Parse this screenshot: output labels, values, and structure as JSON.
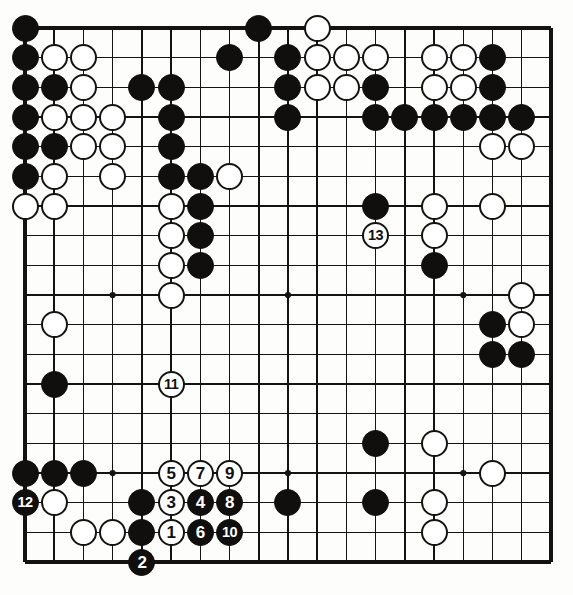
{
  "diagram": {
    "kind": "go-board-diagram",
    "board_size": 19,
    "title": "",
    "colors": {
      "board_background": "#fdfdfb",
      "line": "#141312",
      "black_stone": "#100f0d",
      "white_stone": "#ffffff",
      "black_label_text": "#ffffff",
      "white_label_text": "#111111"
    },
    "geometry": {
      "left": 25,
      "top": 28,
      "right": 551,
      "bottom": 562,
      "col_step": 29.22,
      "row_step": 29.67,
      "stone_diameter": 27
    },
    "star_points": [
      {
        "col": 4,
        "row": 4
      },
      {
        "col": 10,
        "row": 4
      },
      {
        "col": 16,
        "row": 4
      },
      {
        "col": 4,
        "row": 10
      },
      {
        "col": 10,
        "row": 10
      },
      {
        "col": 16,
        "row": 10
      },
      {
        "col": 4,
        "row": 16
      },
      {
        "col": 10,
        "row": 16
      },
      {
        "col": 16,
        "row": 16
      }
    ],
    "stones": [
      {
        "col": 1,
        "row": 1,
        "color": "black"
      },
      {
        "col": 9,
        "row": 1,
        "color": "black"
      },
      {
        "col": 11,
        "row": 1,
        "color": "white"
      },
      {
        "col": 1,
        "row": 2,
        "color": "black"
      },
      {
        "col": 2,
        "row": 2,
        "color": "white"
      },
      {
        "col": 3,
        "row": 2,
        "color": "white"
      },
      {
        "col": 8,
        "row": 2,
        "color": "black"
      },
      {
        "col": 10,
        "row": 2,
        "color": "black"
      },
      {
        "col": 11,
        "row": 2,
        "color": "white"
      },
      {
        "col": 12,
        "row": 2,
        "color": "white"
      },
      {
        "col": 13,
        "row": 2,
        "color": "white"
      },
      {
        "col": 15,
        "row": 2,
        "color": "white"
      },
      {
        "col": 16,
        "row": 2,
        "color": "white"
      },
      {
        "col": 17,
        "row": 2,
        "color": "black"
      },
      {
        "col": 1,
        "row": 3,
        "color": "black"
      },
      {
        "col": 2,
        "row": 3,
        "color": "black"
      },
      {
        "col": 3,
        "row": 3,
        "color": "white"
      },
      {
        "col": 5,
        "row": 3,
        "color": "black"
      },
      {
        "col": 6,
        "row": 3,
        "color": "black"
      },
      {
        "col": 10,
        "row": 3,
        "color": "black"
      },
      {
        "col": 11,
        "row": 3,
        "color": "white"
      },
      {
        "col": 12,
        "row": 3,
        "color": "white"
      },
      {
        "col": 13,
        "row": 3,
        "color": "black"
      },
      {
        "col": 15,
        "row": 3,
        "color": "white"
      },
      {
        "col": 16,
        "row": 3,
        "color": "white"
      },
      {
        "col": 17,
        "row": 3,
        "color": "black"
      },
      {
        "col": 1,
        "row": 4,
        "color": "black"
      },
      {
        "col": 2,
        "row": 4,
        "color": "white"
      },
      {
        "col": 3,
        "row": 4,
        "color": "white"
      },
      {
        "col": 4,
        "row": 4,
        "color": "white"
      },
      {
        "col": 6,
        "row": 4,
        "color": "black"
      },
      {
        "col": 10,
        "row": 4,
        "color": "black"
      },
      {
        "col": 13,
        "row": 4,
        "color": "black"
      },
      {
        "col": 14,
        "row": 4,
        "color": "black"
      },
      {
        "col": 15,
        "row": 4,
        "color": "black"
      },
      {
        "col": 16,
        "row": 4,
        "color": "black"
      },
      {
        "col": 17,
        "row": 4,
        "color": "black"
      },
      {
        "col": 18,
        "row": 4,
        "color": "black"
      },
      {
        "col": 1,
        "row": 5,
        "color": "black"
      },
      {
        "col": 2,
        "row": 5,
        "color": "black"
      },
      {
        "col": 3,
        "row": 5,
        "color": "white"
      },
      {
        "col": 4,
        "row": 5,
        "color": "white"
      },
      {
        "col": 6,
        "row": 5,
        "color": "black"
      },
      {
        "col": 17,
        "row": 5,
        "color": "white"
      },
      {
        "col": 18,
        "row": 5,
        "color": "white"
      },
      {
        "col": 1,
        "row": 6,
        "color": "black"
      },
      {
        "col": 2,
        "row": 6,
        "color": "white"
      },
      {
        "col": 4,
        "row": 6,
        "color": "white"
      },
      {
        "col": 6,
        "row": 6,
        "color": "black"
      },
      {
        "col": 7,
        "row": 6,
        "color": "black"
      },
      {
        "col": 8,
        "row": 6,
        "color": "white"
      },
      {
        "col": 1,
        "row": 7,
        "color": "white"
      },
      {
        "col": 2,
        "row": 7,
        "color": "white"
      },
      {
        "col": 6,
        "row": 7,
        "color": "white"
      },
      {
        "col": 7,
        "row": 7,
        "color": "black"
      },
      {
        "col": 13,
        "row": 7,
        "color": "black"
      },
      {
        "col": 15,
        "row": 7,
        "color": "white"
      },
      {
        "col": 17,
        "row": 7,
        "color": "white"
      },
      {
        "col": 6,
        "row": 8,
        "color": "white"
      },
      {
        "col": 7,
        "row": 8,
        "color": "black"
      },
      {
        "col": 15,
        "row": 8,
        "color": "white"
      },
      {
        "col": 6,
        "row": 9,
        "color": "white"
      },
      {
        "col": 7,
        "row": 9,
        "color": "black"
      },
      {
        "col": 15,
        "row": 9,
        "color": "black"
      },
      {
        "col": 6,
        "row": 10,
        "color": "white"
      },
      {
        "col": 18,
        "row": 10,
        "color": "white"
      },
      {
        "col": 2,
        "row": 11,
        "color": "white"
      },
      {
        "col": 17,
        "row": 11,
        "color": "black"
      },
      {
        "col": 18,
        "row": 11,
        "color": "white"
      },
      {
        "col": 17,
        "row": 12,
        "color": "black"
      },
      {
        "col": 18,
        "row": 12,
        "color": "black"
      },
      {
        "col": 2,
        "row": 13,
        "color": "black"
      },
      {
        "col": 13,
        "row": 15,
        "color": "black"
      },
      {
        "col": 15,
        "row": 15,
        "color": "white"
      },
      {
        "col": 1,
        "row": 16,
        "color": "black"
      },
      {
        "col": 2,
        "row": 16,
        "color": "black"
      },
      {
        "col": 3,
        "row": 16,
        "color": "black"
      },
      {
        "col": 17,
        "row": 16,
        "color": "white"
      },
      {
        "col": 2,
        "row": 17,
        "color": "white"
      },
      {
        "col": 5,
        "row": 17,
        "color": "black"
      },
      {
        "col": 10,
        "row": 17,
        "color": "black"
      },
      {
        "col": 13,
        "row": 17,
        "color": "black"
      },
      {
        "col": 15,
        "row": 17,
        "color": "white"
      },
      {
        "col": 3,
        "row": 18,
        "color": "white"
      },
      {
        "col": 4,
        "row": 18,
        "color": "white"
      },
      {
        "col": 5,
        "row": 18,
        "color": "black"
      },
      {
        "col": 15,
        "row": 18,
        "color": "white"
      }
    ],
    "moves": [
      {
        "num": "1",
        "col": 6,
        "row": 18,
        "color": "white"
      },
      {
        "num": "2",
        "col": 5,
        "row": 19,
        "color": "black"
      },
      {
        "num": "3",
        "col": 6,
        "row": 17,
        "color": "white"
      },
      {
        "num": "4",
        "col": 7,
        "row": 17,
        "color": "black"
      },
      {
        "num": "5",
        "col": 6,
        "row": 16,
        "color": "white"
      },
      {
        "num": "6",
        "col": 7,
        "row": 18,
        "color": "black"
      },
      {
        "num": "7",
        "col": 7,
        "row": 16,
        "color": "white"
      },
      {
        "num": "8",
        "col": 8,
        "row": 17,
        "color": "black"
      },
      {
        "num": "9",
        "col": 8,
        "row": 16,
        "color": "white"
      },
      {
        "num": "10",
        "col": 8,
        "row": 18,
        "color": "black"
      },
      {
        "num": "11",
        "col": 6,
        "row": 13,
        "color": "white"
      },
      {
        "num": "12",
        "col": 1,
        "row": 17,
        "color": "black"
      },
      {
        "num": "13",
        "col": 13,
        "row": 8,
        "color": "white"
      }
    ]
  }
}
